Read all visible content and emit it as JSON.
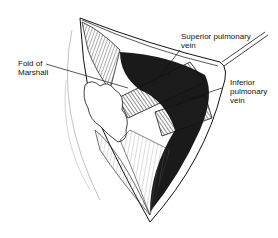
{
  "figure": {
    "labels": [
      {
        "id": "fold_of_marshall",
        "lines": [
          "Fold of",
          "Marshall"
        ]
      },
      {
        "id": "superior_pulmonary_vein",
        "lines": [
          "Superior  pulmonary",
          "vein"
        ]
      },
      {
        "id": "inferior_pulmonary_vein",
        "lines": [
          "Inferior",
          "pulmonary",
          "vein"
        ]
      }
    ],
    "colors": {
      "ink": "#111111",
      "background": "#ffffff",
      "dark_fill": "#1a1a1a"
    }
  }
}
